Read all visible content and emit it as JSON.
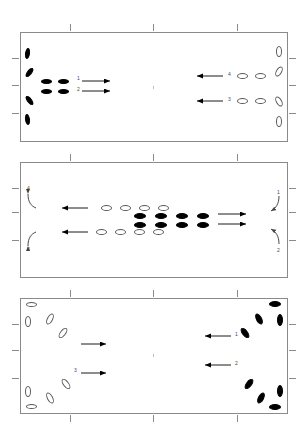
{
  "figure": {
    "type": "multi-panel-schematic",
    "panel_count": 3,
    "width": 308,
    "height": 440,
    "background_color": "#ffffff",
    "frame_color": "#8a8a8a",
    "filled_marker_color": "#000000",
    "open_marker_color": "#5a5a5a",
    "label_color": "#4a4a4a"
  },
  "panels": [
    {
      "id": "panel-1",
      "name": "top-panel",
      "frame": {
        "x": 20,
        "y": 32,
        "width": 268,
        "height": 110
      },
      "top_ticks": [
        70,
        153,
        237
      ],
      "left_ticks": [
        58,
        85,
        113
      ],
      "right_ticks": [
        58,
        85,
        113
      ],
      "arrow_labels": [
        "1",
        "2",
        "4",
        "3"
      ],
      "left_arrow_labels": [
        "1",
        "2"
      ],
      "right_arrow_labels": [
        "4",
        "3"
      ],
      "left_group_fill": "filled",
      "right_group_fill": "open",
      "left_arrow_direction": "right",
      "right_arrow_direction": "left",
      "center_dot": true
    },
    {
      "id": "panel-2",
      "name": "middle-panel",
      "frame": {
        "x": 20,
        "y": 162,
        "width": 268,
        "height": 116
      },
      "top_ticks": [
        70,
        153,
        237
      ],
      "left_ticks": [
        188,
        212,
        240
      ],
      "right_ticks": [
        188,
        212,
        240
      ],
      "arrow_labels": [
        "4",
        "3",
        "1",
        "2"
      ],
      "left_curve_labels": [
        "4",
        "3"
      ],
      "right_curve_labels": [
        "1",
        "2"
      ],
      "center_group_open_fill": "open",
      "center_group_filled_fill": "filled",
      "left_arrow_direction": "left",
      "right_arrow_direction": "right"
    },
    {
      "id": "panel-3",
      "name": "bottom-panel",
      "frame": {
        "x": 20,
        "y": 298,
        "width": 268,
        "height": 116
      },
      "top_ticks": [
        70,
        153,
        237
      ],
      "bottom_ticks": [
        70,
        153,
        237
      ],
      "left_ticks": [
        324,
        350,
        378
      ],
      "right_ticks": [
        324,
        350,
        378
      ],
      "arrow_labels": [
        "3",
        "1",
        "2"
      ],
      "left_arrow_labels": [
        "",
        "3"
      ],
      "right_arrow_labels": [
        "1",
        "2"
      ],
      "left_group_fill": "open",
      "right_group_fill": "filled",
      "left_arrow_direction": "right",
      "right_arrow_direction": "left",
      "center_dot": true
    }
  ],
  "panel1": {
    "left_edge_markers": [
      {
        "x": 25,
        "y": 48,
        "w": 5,
        "h": 11,
        "rot": 8,
        "fill": "filled"
      },
      {
        "x": 27,
        "y": 67,
        "w": 5,
        "h": 11,
        "rot": 38,
        "fill": "filled"
      },
      {
        "x": 27,
        "y": 95,
        "w": 5,
        "h": 11,
        "rot": -38,
        "fill": "filled"
      },
      {
        "x": 25,
        "y": 114,
        "w": 5,
        "h": 11,
        "rot": -8,
        "fill": "filled"
      }
    ],
    "left_cluster": [
      {
        "x": 41,
        "y": 79,
        "w": 11,
        "h": 5,
        "rot": 0,
        "fill": "filled"
      },
      {
        "x": 41,
        "y": 89,
        "w": 11,
        "h": 5,
        "rot": 0,
        "fill": "filled"
      },
      {
        "x": 58,
        "y": 79,
        "w": 11,
        "h": 5,
        "rot": 0,
        "fill": "filled"
      },
      {
        "x": 58,
        "y": 89,
        "w": 11,
        "h": 5,
        "rot": 0,
        "fill": "filled"
      }
    ],
    "left_arrows": [
      {
        "x1": 82,
        "y1": 81,
        "x2": 110,
        "y2": 81,
        "dir": "right",
        "label": "1",
        "lx": 77,
        "ly": 76
      },
      {
        "x1": 82,
        "y1": 91,
        "x2": 110,
        "y2": 91,
        "dir": "right",
        "label": "2",
        "lx": 77,
        "ly": 87
      }
    ],
    "right_arrows": [
      {
        "x1": 223,
        "y1": 76,
        "x2": 197,
        "y2": 76,
        "dir": "left",
        "label": "4",
        "lx": 228,
        "ly": 72
      },
      {
        "x1": 223,
        "y1": 101,
        "x2": 197,
        "y2": 101,
        "dir": "left",
        "label": "3",
        "lx": 228,
        "ly": 97
      }
    ],
    "right_cluster": [
      {
        "x": 237,
        "y": 73,
        "w": 11,
        "h": 6,
        "rot": 0,
        "fill": "open"
      },
      {
        "x": 255,
        "y": 73,
        "w": 11,
        "h": 6,
        "rot": 0,
        "fill": "open"
      },
      {
        "x": 237,
        "y": 98,
        "w": 11,
        "h": 6,
        "rot": 0,
        "fill": "open"
      },
      {
        "x": 255,
        "y": 98,
        "w": 11,
        "h": 6,
        "rot": 0,
        "fill": "open"
      }
    ],
    "right_edge_markers": [
      {
        "x": 276,
        "y": 46,
        "w": 6,
        "h": 11,
        "rot": 0,
        "fill": "open"
      },
      {
        "x": 276,
        "y": 66,
        "w": 6,
        "h": 11,
        "rot": 30,
        "fill": "open"
      },
      {
        "x": 276,
        "y": 96,
        "w": 6,
        "h": 11,
        "rot": -30,
        "fill": "open"
      },
      {
        "x": 276,
        "y": 116,
        "w": 6,
        "h": 11,
        "rot": 0,
        "fill": "open"
      }
    ],
    "center_dot": {
      "x": 153,
      "y": 86
    }
  },
  "panel2": {
    "left_curves": [
      {
        "label": "4",
        "lx": 27,
        "ly": 186,
        "path": "M 28 194 C 28 202, 31 206, 36 208",
        "arrow_at": "start"
      },
      {
        "label": "3",
        "lx": 27,
        "ly": 247,
        "path": "M 28 246 C 28 238, 31 234, 36 232",
        "arrow_at": "start"
      }
    ],
    "left_arrows": [
      {
        "x1": 88,
        "y1": 208,
        "x2": 62,
        "y2": 208,
        "dir": "left"
      },
      {
        "x1": 88,
        "y1": 232,
        "x2": 62,
        "y2": 232,
        "dir": "left"
      }
    ],
    "top_open_row": [
      {
        "x": 101,
        "y": 205,
        "w": 11,
        "h": 6,
        "fill": "open"
      },
      {
        "x": 120,
        "y": 205,
        "w": 11,
        "h": 6,
        "fill": "open"
      },
      {
        "x": 139,
        "y": 205,
        "w": 11,
        "h": 6,
        "fill": "open"
      },
      {
        "x": 158,
        "y": 205,
        "w": 11,
        "h": 6,
        "fill": "open"
      }
    ],
    "bottom_open_row": [
      {
        "x": 96,
        "y": 229,
        "w": 11,
        "h": 6,
        "fill": "open"
      },
      {
        "x": 115,
        "y": 229,
        "w": 11,
        "h": 6,
        "fill": "open"
      },
      {
        "x": 134,
        "y": 229,
        "w": 11,
        "h": 6,
        "fill": "open"
      },
      {
        "x": 153,
        "y": 229,
        "w": 11,
        "h": 6,
        "fill": "open"
      }
    ],
    "filled_cluster": [
      {
        "x": 134,
        "y": 213,
        "w": 12,
        "h": 6,
        "fill": "filled"
      },
      {
        "x": 134,
        "y": 222,
        "w": 12,
        "h": 6,
        "fill": "filled"
      },
      {
        "x": 155,
        "y": 213,
        "w": 12,
        "h": 6,
        "fill": "filled"
      },
      {
        "x": 155,
        "y": 222,
        "w": 12,
        "h": 6,
        "fill": "filled"
      },
      {
        "x": 176,
        "y": 213,
        "w": 12,
        "h": 6,
        "fill": "filled"
      },
      {
        "x": 176,
        "y": 222,
        "w": 12,
        "h": 6,
        "fill": "filled"
      },
      {
        "x": 197,
        "y": 213,
        "w": 12,
        "h": 6,
        "fill": "filled"
      },
      {
        "x": 197,
        "y": 222,
        "w": 12,
        "h": 6,
        "fill": "filled"
      }
    ],
    "right_arrows": [
      {
        "x1": 218,
        "y1": 214,
        "x2": 246,
        "y2": 214,
        "dir": "right"
      },
      {
        "x1": 218,
        "y1": 224,
        "x2": 246,
        "y2": 224,
        "dir": "right"
      }
    ],
    "right_curves": [
      {
        "label": "1",
        "lx": 277,
        "ly": 190,
        "path": "M 279 196 C 279 204, 276 208, 271 211",
        "arrow_at": "end"
      },
      {
        "label": "2",
        "lx": 277,
        "ly": 248,
        "path": "M 279 244 C 279 236, 276 232, 271 229",
        "arrow_at": "end"
      }
    ]
  },
  "panel3": {
    "left_edge_markers": [
      {
        "x": 26,
        "y": 302,
        "w": 11,
        "h": 5,
        "rot": 0,
        "fill": "open"
      },
      {
        "x": 25,
        "y": 316,
        "w": 6,
        "h": 11,
        "rot": 0,
        "fill": "open"
      },
      {
        "x": 25,
        "y": 386,
        "w": 6,
        "h": 11,
        "rot": 0,
        "fill": "open"
      },
      {
        "x": 26,
        "y": 404,
        "w": 11,
        "h": 5,
        "rot": 0,
        "fill": "open"
      }
    ],
    "left_fan": [
      {
        "x": 47,
        "y": 313,
        "w": 6,
        "h": 12,
        "rot": 28,
        "fill": "open"
      },
      {
        "x": 60,
        "y": 327,
        "w": 6,
        "h": 12,
        "rot": 38,
        "fill": "open"
      },
      {
        "x": 47,
        "y": 392,
        "w": 6,
        "h": 12,
        "rot": -28,
        "fill": "open"
      },
      {
        "x": 63,
        "y": 378,
        "w": 6,
        "h": 12,
        "rot": -38,
        "fill": "open"
      }
    ],
    "left_arrows": [
      {
        "x1": 81,
        "y1": 344,
        "x2": 106,
        "y2": 344,
        "dir": "right",
        "label": "",
        "lx": 0,
        "ly": 0
      },
      {
        "x1": 81,
        "y1": 373,
        "x2": 106,
        "y2": 373,
        "dir": "right",
        "label": "3",
        "lx": 74,
        "ly": 368
      }
    ],
    "right_arrows": [
      {
        "x1": 231,
        "y1": 336,
        "x2": 205,
        "y2": 336,
        "dir": "left",
        "label": "1",
        "lx": 235,
        "ly": 332
      },
      {
        "x1": 231,
        "y1": 365,
        "x2": 205,
        "y2": 365,
        "dir": "left",
        "label": "2",
        "lx": 235,
        "ly": 361
      }
    ],
    "right_fan": [
      {
        "x": 242,
        "y": 327,
        "w": 6,
        "h": 12,
        "rot": -38,
        "fill": "filled"
      },
      {
        "x": 256,
        "y": 313,
        "w": 6,
        "h": 12,
        "rot": -28,
        "fill": "filled"
      },
      {
        "x": 246,
        "y": 378,
        "w": 6,
        "h": 12,
        "rot": 38,
        "fill": "filled"
      },
      {
        "x": 258,
        "y": 392,
        "w": 6,
        "h": 12,
        "rot": 28,
        "fill": "filled"
      }
    ],
    "right_edge_markers": [
      {
        "x": 269,
        "y": 301,
        "w": 12,
        "h": 6,
        "rot": 0,
        "fill": "filled"
      },
      {
        "x": 277,
        "y": 314,
        "w": 6,
        "h": 12,
        "rot": 0,
        "fill": "filled"
      },
      {
        "x": 277,
        "y": 385,
        "w": 6,
        "h": 12,
        "rot": 0,
        "fill": "filled"
      },
      {
        "x": 269,
        "y": 404,
        "w": 12,
        "h": 6,
        "rot": 0,
        "fill": "filled"
      }
    ],
    "center_dot": {
      "x": 153,
      "y": 354
    }
  }
}
